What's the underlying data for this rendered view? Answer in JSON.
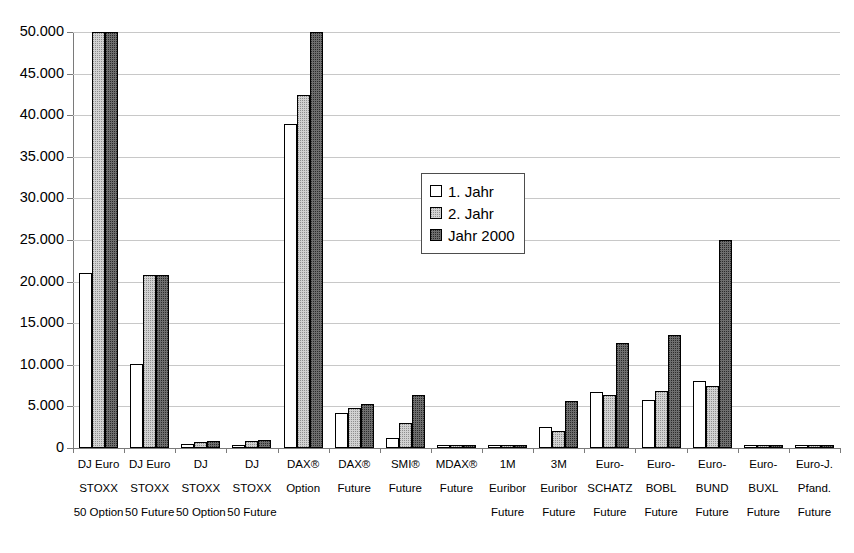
{
  "chart_data": {
    "type": "bar",
    "title": "",
    "subtitle": "",
    "xlabel": "",
    "ylabel": "",
    "ylim": [
      0,
      50000
    ],
    "ytick_labels": [
      "0",
      "5.000",
      "10.000",
      "15.000",
      "20.000",
      "25.000",
      "30.000",
      "35.000",
      "40.000",
      "45.000",
      "50.000"
    ],
    "ytick_values": [
      0,
      5000,
      10000,
      15000,
      20000,
      25000,
      30000,
      35000,
      40000,
      45000,
      50000
    ],
    "grid": true,
    "legend_position": "center",
    "note": "Bars for 2. Jahr and Jahr 2000 in the DJ Euro STOXX 50 Option and DAX(R) Option groups are clipped at the top of the plot (values exceed 50.000).",
    "categories": [
      {
        "lines": [
          "DJ Euro",
          "STOXX",
          "50 Option"
        ]
      },
      {
        "lines": [
          "DJ Euro",
          "STOXX",
          "50 Future"
        ]
      },
      {
        "lines": [
          "DJ",
          "STOXX",
          "50 Option"
        ]
      },
      {
        "lines": [
          "DJ",
          "STOXX",
          "50 Future"
        ]
      },
      {
        "lines": [
          "DAX®",
          "Option",
          ""
        ]
      },
      {
        "lines": [
          "DAX®",
          "Future",
          ""
        ]
      },
      {
        "lines": [
          "SMI®",
          "Future",
          ""
        ]
      },
      {
        "lines": [
          "MDAX®",
          "Future",
          ""
        ]
      },
      {
        "lines": [
          "1M",
          "Euribor",
          "Future"
        ]
      },
      {
        "lines": [
          "3M",
          "Euribor",
          "Future"
        ]
      },
      {
        "lines": [
          "Euro-",
          "SCHATZ",
          "Future"
        ]
      },
      {
        "lines": [
          "Euro-",
          "BOBL",
          "Future"
        ]
      },
      {
        "lines": [
          "Euro-",
          "BUND",
          "Future"
        ]
      },
      {
        "lines": [
          "Euro-",
          "BUXL",
          "Future"
        ]
      },
      {
        "lines": [
          "Euro-J.",
          "Pfand.",
          "Future"
        ]
      }
    ],
    "series": [
      {
        "name": "1. Jahr",
        "fill": "white",
        "values": [
          21000,
          10100,
          500,
          350,
          39000,
          4200,
          1200,
          250,
          120,
          2500,
          6700,
          5800,
          8000,
          60,
          60
        ]
      },
      {
        "name": "2. Jahr",
        "fill": "light-gray-dotted",
        "values": [
          52000,
          20800,
          750,
          900,
          42400,
          4800,
          3050,
          400,
          300,
          2000,
          6400,
          6900,
          7500,
          60,
          60
        ]
      },
      {
        "name": "Jahr 2000",
        "fill": "dark-gray-dotted",
        "values": [
          52000,
          20800,
          800,
          1000,
          52000,
          5350,
          6400,
          400,
          350,
          5700,
          12600,
          13600,
          25000,
          150,
          250
        ]
      }
    ]
  },
  "legend": {
    "entries": [
      {
        "label": "1. Jahr"
      },
      {
        "label": "2. Jahr"
      },
      {
        "label": "Jahr 2000"
      }
    ]
  },
  "colors": {
    "series_1": "#ffffff",
    "series_2": "#d2d2d2",
    "series_3": "#6e6e6e",
    "axis": "#7a7a7a",
    "grid": "#c8c8c8",
    "text": "#000000",
    "background": "#ffffff"
  }
}
